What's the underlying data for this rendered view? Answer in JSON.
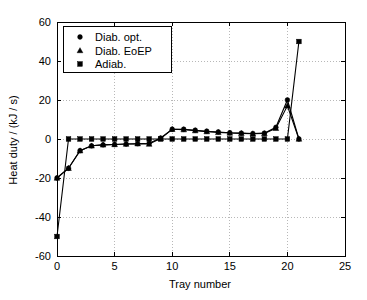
{
  "chart_data": {
    "type": "line",
    "title": "",
    "xlabel": "Tray number",
    "ylabel": "Heat duty / (kJ / s)",
    "xlim": [
      0,
      25
    ],
    "ylim": [
      -60,
      60
    ],
    "xticks": [
      "0",
      "5",
      "10",
      "15",
      "20",
      "25"
    ],
    "xtick_values": [
      0,
      5,
      10,
      15,
      20,
      25
    ],
    "yticks": [
      "60",
      "40",
      "20",
      "0",
      "-20",
      "-40",
      "-60"
    ],
    "ytick_values": [
      60,
      40,
      20,
      0,
      -20,
      -40,
      -60
    ],
    "grid": true,
    "legend_position": "top-left",
    "x": [
      0,
      1,
      2,
      3,
      4,
      5,
      6,
      7,
      8,
      9,
      10,
      11,
      12,
      13,
      14,
      15,
      16,
      17,
      18,
      19,
      20,
      21
    ],
    "series": [
      {
        "name": "Diab. opt.",
        "marker": "circle",
        "values": [
          -20,
          -15,
          -6,
          -3.5,
          -3,
          -2.8,
          -2.6,
          -2.4,
          -2.2,
          0.5,
          5,
          5,
          4.5,
          4,
          3.6,
          3.2,
          3,
          2.8,
          3,
          6,
          20,
          0
        ]
      },
      {
        "name": "Diab. EoEP",
        "marker": "triangle",
        "values": [
          -20,
          -15,
          -6,
          -3.5,
          -3,
          -2.8,
          -2.6,
          -2.4,
          -2.6,
          0.3,
          5,
          4.8,
          4.3,
          3.8,
          3.4,
          3.1,
          2.9,
          2.7,
          2.8,
          5.5,
          17,
          0
        ]
      },
      {
        "name": "Adiab.",
        "marker": "square",
        "values": [
          -50,
          0,
          0,
          0,
          0,
          0,
          0,
          0,
          0,
          0,
          0,
          0,
          0,
          0,
          0,
          0,
          0,
          0,
          0,
          0,
          0,
          50
        ]
      }
    ]
  },
  "legend": {
    "entries": [
      {
        "label": "Diab. opt.",
        "marker": "circle"
      },
      {
        "label": "Diab. EoEP",
        "marker": "triangle"
      },
      {
        "label": "Adiab.",
        "marker": "square"
      }
    ]
  },
  "colors": {
    "line": "#000000",
    "marker": "#000000",
    "grid": "#9a9a9a",
    "axis": "#000000",
    "background": "#ffffff"
  }
}
